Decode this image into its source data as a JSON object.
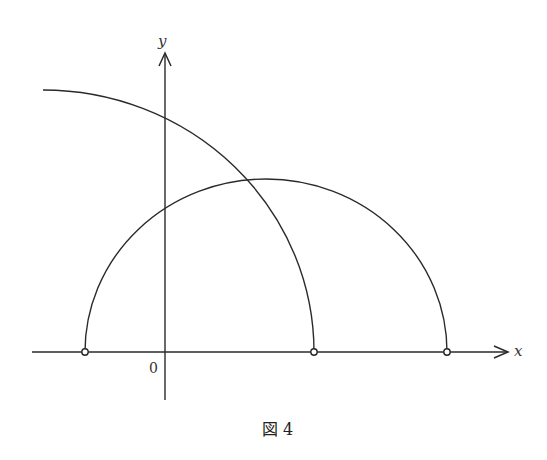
{
  "figure": {
    "caption": "図 4",
    "axes": {
      "x_label": "x",
      "y_label": "y",
      "origin_label": "0"
    },
    "curves": [
      {
        "name": "large-quarter-arc",
        "description": "arc from upper-left descending to x-axis"
      },
      {
        "name": "semicircle",
        "description": "semicircle resting on x-axis"
      }
    ],
    "points": [
      {
        "name": "semicircle-left-endpoint",
        "style": "open-circle"
      },
      {
        "name": "large-arc-endpoint",
        "style": "open-circle"
      },
      {
        "name": "semicircle-right-endpoint",
        "style": "open-circle"
      }
    ],
    "colors": {
      "stroke": "#2a2a2a",
      "background": "#ffffff"
    }
  }
}
